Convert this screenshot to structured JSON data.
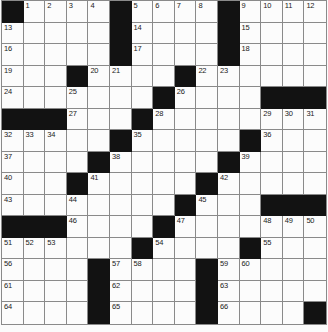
{
  "grid": {
    "rows": 15,
    "cols": 15,
    "black_cells": [
      [
        0,
        0
      ],
      [
        0,
        5
      ],
      [
        0,
        10
      ],
      [
        1,
        5
      ],
      [
        1,
        10
      ],
      [
        2,
        5
      ],
      [
        2,
        10
      ],
      [
        3,
        3
      ],
      [
        3,
        8
      ],
      [
        4,
        7
      ],
      [
        4,
        12
      ],
      [
        4,
        13
      ],
      [
        4,
        14
      ],
      [
        5,
        0
      ],
      [
        5,
        1
      ],
      [
        5,
        2
      ],
      [
        5,
        6
      ],
      [
        6,
        5
      ],
      [
        6,
        11
      ],
      [
        7,
        4
      ],
      [
        7,
        10
      ],
      [
        8,
        3
      ],
      [
        8,
        9
      ],
      [
        9,
        8
      ],
      [
        9,
        12
      ],
      [
        9,
        13
      ],
      [
        9,
        14
      ],
      [
        10,
        0
      ],
      [
        10,
        1
      ],
      [
        10,
        2
      ],
      [
        10,
        7
      ],
      [
        11,
        6
      ],
      [
        11,
        11
      ],
      [
        12,
        4
      ],
      [
        12,
        9
      ],
      [
        13,
        4
      ],
      [
        13,
        9
      ],
      [
        14,
        4
      ],
      [
        14,
        9
      ],
      [
        14,
        14
      ]
    ],
    "numbers": {
      "0-1": 1,
      "0-2": 2,
      "0-3": 3,
      "0-4": 4,
      "0-6": 5,
      "0-7": 6,
      "0-8": 7,
      "0-9": 8,
      "0-11": 9,
      "0-12": 10,
      "0-13": 11,
      "0-14": 12,
      "1-0": 13,
      "1-6": 14,
      "1-11": 15,
      "2-0": 16,
      "2-6": 17,
      "2-11": 18,
      "3-0": 19,
      "3-4": 20,
      "3-5": 21,
      "3-9": 22,
      "3-10": 23,
      "4-0": 24,
      "4-3": 25,
      "4-8": 26,
      "5-3": 27,
      "5-7": 28,
      "5-12": 29,
      "5-13": 30,
      "5-14": 31,
      "6-0": 32,
      "6-1": 33,
      "6-2": 34,
      "6-6": 35,
      "6-12": 36,
      "7-0": 37,
      "7-5": 38,
      "7-11": 39,
      "8-0": 40,
      "8-4": 41,
      "8-10": 42,
      "9-0": 43,
      "9-3": 44,
      "9-9": 45,
      "10-3": 46,
      "10-8": 47,
      "10-12": 48,
      "10-13": 49,
      "10-14": 50,
      "11-0": 51,
      "11-1": 52,
      "11-2": 53,
      "11-7": 54,
      "11-12": 55,
      "12-0": 56,
      "12-5": 57,
      "12-6": 58,
      "12-10": 59,
      "12-11": 60,
      "13-0": 61,
      "13-5": 62,
      "13-10": 63,
      "14-0": 64,
      "14-5": 65,
      "14-10": 66
    }
  },
  "colors": {
    "page_bg": "#fbfbfb",
    "cell_bg": "#fcfcfc",
    "black_cell": "#121212",
    "grid_line": "#8a8a8a",
    "number_text": "#222222"
  }
}
